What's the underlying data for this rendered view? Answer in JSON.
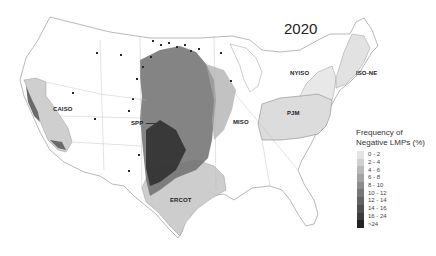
{
  "title": "2020",
  "regions": [
    {
      "id": "caiso",
      "label": "CAISO",
      "x": 53,
      "y": 109
    },
    {
      "id": "spp",
      "label": "SPP",
      "x": 131,
      "y": 120
    },
    {
      "id": "miso",
      "label": "MISO",
      "x": 232,
      "y": 120
    },
    {
      "id": "pjm",
      "label": "PJM",
      "x": 286,
      "y": 110
    },
    {
      "id": "nyiso",
      "label": "NYISO",
      "x": 290,
      "y": 71
    },
    {
      "id": "isone",
      "label": "ISO-NE",
      "x": 355,
      "y": 70
    },
    {
      "id": "ercot",
      "label": "ERCOT",
      "x": 170,
      "y": 197
    }
  ],
  "legend": {
    "title_line1": "Frequency of",
    "title_line2": "Negative LMPs (%)",
    "items": [
      {
        "label": "0 - 2",
        "color": "#e4e4e4"
      },
      {
        "label": "2 - 4",
        "color": "#cfcfcf"
      },
      {
        "label": "4 - 6",
        "color": "#b9b9b9"
      },
      {
        "label": "6 - 8",
        "color": "#a2a2a2"
      },
      {
        "label": "8 - 10",
        "color": "#8c8c8c"
      },
      {
        "label": "10 - 12",
        "color": "#777777"
      },
      {
        "label": "12 - 14",
        "color": "#636363"
      },
      {
        "label": "14 - 16",
        "color": "#4f4f4f"
      },
      {
        "label": "16 - 24",
        "color": "#3c3c3c"
      },
      {
        "label": ">24",
        "color": "#222222"
      }
    ]
  },
  "colors": {
    "boundary": "#9a9a9a",
    "iso_fill_light": "#dcdcdc",
    "background": "#ffffff"
  }
}
